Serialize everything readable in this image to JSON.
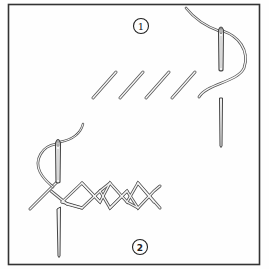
{
  "figure": {
    "type": "stitch-illustration",
    "panels": [
      {
        "id": "step-1",
        "label": "1",
        "description": "Row of four parallel diagonal stitches with needle and thread pulled through"
      },
      {
        "id": "step-2",
        "label": "2",
        "description": "Herringbone cross stitch row worked over diagonal stitches with needle inserted"
      }
    ],
    "colors": {
      "line": "#444444",
      "thread_fill": "#f4f4f4",
      "frame": "#333333",
      "background": "#fefefe"
    }
  }
}
